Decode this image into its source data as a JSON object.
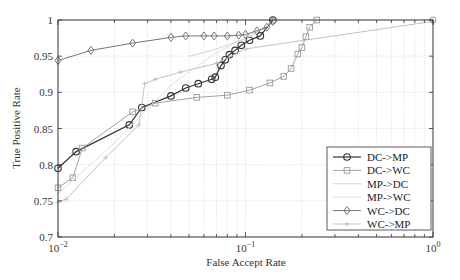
{
  "chart_data": {
    "type": "line",
    "title": "",
    "xlabel": "False Accept Rate",
    "ylabel": "True Positive Rate",
    "xscale": "log",
    "xlim": [
      0.01,
      1
    ],
    "ylim": [
      0.7,
      1
    ],
    "grid": true,
    "legend_position": "lower right",
    "x_tick_labels": [
      "10^-2",
      "10^-1",
      "10^0"
    ],
    "y_tick_labels": [
      "0.7",
      "0.75",
      "0.8",
      "0.85",
      "0.9",
      "0.95",
      "1"
    ],
    "series": [
      {
        "name": "DC->MP",
        "color": "#333333",
        "marker": "circle",
        "x": [
          0.01,
          0.0125,
          0.024,
          0.028,
          0.04,
          0.048,
          0.056,
          0.066,
          0.069,
          0.074,
          0.078,
          0.082,
          0.088,
          0.095,
          0.105,
          0.12,
          0.14
        ],
        "y": [
          0.795,
          0.818,
          0.855,
          0.879,
          0.895,
          0.906,
          0.912,
          0.918,
          0.921,
          0.937,
          0.945,
          0.952,
          0.958,
          0.965,
          0.972,
          0.978,
          1.0
        ]
      },
      {
        "name": "DC->WC",
        "color": "#999999",
        "marker": "square",
        "x": [
          0.01,
          0.012,
          0.0135,
          0.025,
          0.033,
          0.055,
          0.08,
          0.105,
          0.135,
          0.16,
          0.175,
          0.19,
          0.2,
          0.21,
          0.22,
          0.24
        ],
        "y": [
          0.768,
          0.782,
          0.823,
          0.873,
          0.885,
          0.893,
          0.896,
          0.903,
          0.913,
          0.922,
          0.933,
          0.953,
          0.962,
          0.977,
          0.99,
          1.0
        ]
      },
      {
        "name": "MP->DC",
        "color": "#cccccc",
        "marker": "none",
        "x": [
          0.05,
          0.06,
          0.07,
          0.08,
          0.09,
          0.1,
          0.12,
          0.15
        ],
        "y": [
          0.95,
          0.955,
          0.96,
          0.965,
          0.97,
          0.975,
          0.985,
          1.0
        ]
      },
      {
        "name": "MP->WC",
        "color": "#dddddd",
        "marker": "none",
        "x": [
          0.01,
          0.02,
          0.04,
          0.07,
          0.1,
          0.15
        ],
        "y": [
          0.76,
          0.83,
          0.91,
          0.955,
          0.975,
          1.0
        ]
      },
      {
        "name": "WC->DC",
        "color": "#666666",
        "marker": "diamond",
        "x": [
          0.01,
          0.015,
          0.025,
          0.04,
          0.048,
          0.06,
          0.068,
          0.08,
          0.092,
          0.1,
          0.115,
          0.13,
          0.14
        ],
        "y": [
          0.944,
          0.958,
          0.968,
          0.976,
          0.978,
          0.978,
          0.978,
          0.978,
          0.979,
          0.98,
          0.985,
          0.99,
          0.998
        ]
      },
      {
        "name": "WC->MP",
        "color": "#bbbbbb",
        "marker": "plus",
        "x": [
          0.01,
          0.011,
          0.018,
          0.027,
          0.029,
          0.033,
          0.045,
          0.07,
          0.1,
          1.0
        ],
        "y": [
          0.748,
          0.752,
          0.81,
          0.855,
          0.912,
          0.918,
          0.928,
          0.94,
          0.96,
          0.998
        ]
      }
    ]
  }
}
